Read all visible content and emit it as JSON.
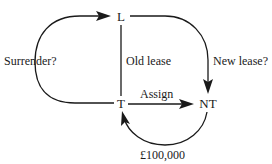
{
  "diagram": {
    "nodes": [
      {
        "id": "L",
        "label": "L"
      },
      {
        "id": "T",
        "label": "T"
      },
      {
        "id": "NT",
        "label": "NT"
      }
    ],
    "edges": [
      {
        "id": "surrender",
        "from": "T",
        "to": "L",
        "label": "Surrender?"
      },
      {
        "id": "old-lease",
        "from": "L",
        "to": "T",
        "label": "Old lease"
      },
      {
        "id": "new-lease",
        "from": "L",
        "to": "NT",
        "label": "New lease?"
      },
      {
        "id": "assign",
        "from": "T",
        "to": "NT",
        "label": "Assign"
      },
      {
        "id": "payment",
        "from": "NT",
        "to": "T",
        "label": "£100,000"
      }
    ]
  }
}
